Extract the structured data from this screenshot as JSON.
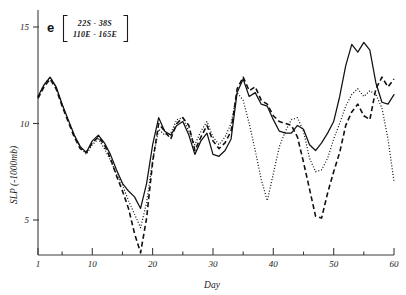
{
  "chart_data": {
    "type": "line",
    "title": "",
    "panel_label": "e",
    "annotation_lines": [
      "22S - 38S",
      "110E - 165E"
    ],
    "xlabel": "Day",
    "ylabel": "SLP (-1000mb)",
    "xlim": [
      1,
      60
    ],
    "ylim": [
      2.2,
      15.8
    ],
    "grid": false,
    "legend": "none",
    "x_ticks_major": [
      1,
      10,
      20,
      30,
      40,
      50,
      60
    ],
    "x_tick_labels": [
      "1",
      "10",
      "20",
      "30",
      "40",
      "50",
      "60"
    ],
    "x_ticks_minor": [
      5,
      15,
      25,
      35,
      45,
      55
    ],
    "y_ticks_major": [
      5,
      10,
      15
    ],
    "y_tick_labels": [
      "5",
      "10",
      "15"
    ],
    "x": [
      1,
      2,
      3,
      4,
      5,
      6,
      7,
      8,
      9,
      10,
      11,
      12,
      13,
      14,
      15,
      16,
      17,
      18,
      19,
      20,
      21,
      22,
      23,
      24,
      25,
      26,
      27,
      28,
      29,
      30,
      31,
      32,
      33,
      34,
      35,
      36,
      37,
      38,
      39,
      40,
      41,
      42,
      43,
      44,
      45,
      46,
      47,
      48,
      49,
      50,
      51,
      52,
      53,
      54,
      55,
      56,
      57,
      58,
      59,
      60
    ],
    "series": [
      {
        "name": "solid",
        "style": "solid",
        "values": [
          11.4,
          12.0,
          12.4,
          11.9,
          11.0,
          10.2,
          9.4,
          8.8,
          8.5,
          9.1,
          9.4,
          9.0,
          8.4,
          7.6,
          6.9,
          6.5,
          6.2,
          5.6,
          6.9,
          8.9,
          10.3,
          9.6,
          9.4,
          9.9,
          10.1,
          9.4,
          8.4,
          9.1,
          9.5,
          8.4,
          8.3,
          8.6,
          9.2,
          11.6,
          12.3,
          11.4,
          11.6,
          11.0,
          10.9,
          10.2,
          9.6,
          9.5,
          9.5,
          9.9,
          9.7,
          8.9,
          8.6,
          9.0,
          9.5,
          10.1,
          11.4,
          13.0,
          14.1,
          13.7,
          14.2,
          13.8,
          12.1,
          11.1,
          11.0,
          11.5
        ]
      },
      {
        "name": "dashed",
        "style": "dashed",
        "values": [
          11.3,
          11.9,
          12.3,
          11.8,
          10.9,
          10.1,
          9.3,
          8.7,
          8.5,
          9.0,
          9.3,
          8.9,
          8.2,
          7.3,
          6.5,
          5.6,
          4.3,
          3.3,
          5.1,
          8.0,
          10.0,
          9.6,
          9.2,
          10.0,
          10.3,
          9.9,
          8.6,
          9.3,
          9.9,
          9.1,
          8.7,
          9.0,
          9.6,
          11.8,
          12.4,
          11.7,
          11.9,
          11.2,
          11.0,
          10.4,
          10.1,
          10.0,
          9.9,
          9.3,
          8.0,
          6.6,
          5.2,
          5.1,
          6.4,
          7.5,
          8.5,
          9.9,
          10.6,
          11.0,
          10.4,
          10.2,
          11.8,
          12.4,
          11.9,
          12.3
        ]
      },
      {
        "name": "dotted",
        "style": "dotted",
        "values": [
          11.4,
          12.0,
          12.4,
          11.9,
          11.0,
          10.2,
          9.4,
          8.8,
          8.4,
          8.9,
          9.2,
          8.7,
          8.1,
          7.4,
          6.8,
          6.0,
          5.3,
          4.6,
          5.9,
          8.1,
          9.7,
          9.4,
          9.5,
          10.2,
          10.3,
          9.6,
          8.9,
          9.6,
          10.1,
          9.3,
          8.9,
          9.3,
          10.0,
          11.6,
          11.2,
          10.0,
          8.6,
          7.1,
          6.0,
          7.4,
          8.8,
          9.6,
          10.2,
          10.3,
          9.6,
          8.2,
          7.5,
          7.6,
          8.2,
          9.2,
          10.0,
          10.9,
          11.5,
          11.8,
          11.4,
          11.7,
          11.5,
          10.8,
          9.2,
          7.0
        ]
      }
    ]
  }
}
